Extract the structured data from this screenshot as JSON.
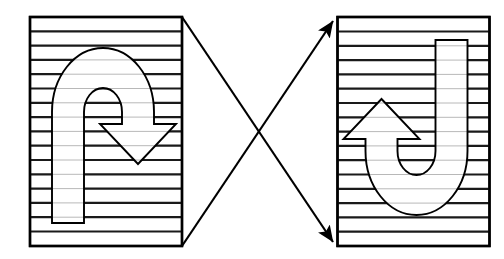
{
  "canvas": {
    "width": 504,
    "height": 259,
    "background": "#ffffff",
    "title": "Mental rotation figure pair"
  },
  "style": {
    "outline_color": "#000000",
    "stripe_outside_color": "#1a1a1a",
    "stripe_inside_color": "#b0b0b0",
    "shape_fill": "#ffffff",
    "panel_fill": "#ffffff",
    "arrow_color": "#000000",
    "panel_border_width": 2.4,
    "stripe_outside_width": 2.2,
    "stripe_inside_width": 0.9,
    "shape_outline_width": 1.9,
    "connector_width": 2.2
  },
  "panels": [
    {
      "id": "left-panel",
      "label": "Left striped panel",
      "x": 30,
      "y": 17,
      "width": 152,
      "height": 229,
      "stripe_count": 16,
      "stripe_spacing": 14.3,
      "rotation_degrees": 0,
      "shape_name": "hook-arrow-shape"
    },
    {
      "id": "right-panel",
      "label": "Right striped panel",
      "x": 338,
      "y": 17,
      "width": 151,
      "height": 229,
      "stripe_count": 16,
      "stripe_spacing": 14.3,
      "rotation_degrees": 180,
      "shape_name": "hook-arrow-shape"
    }
  ],
  "shape": {
    "name": "hook-arrow-shape",
    "description": "U-turn hook with downward triangular arrowhead",
    "outer_arc_top_y": 48,
    "stem_bottom_y": 223,
    "arrow_tip_x": 138,
    "arrow_tip_y": 164
  },
  "connectors": [
    {
      "id": "connector-top-left-to-bottom-right",
      "label": "Diagonal from left panel top-right to right panel bottom-left",
      "from_x": 182,
      "from_y": 17,
      "to_x": 338,
      "to_y": 246,
      "arrowhead": "end",
      "direction": "down-right"
    },
    {
      "id": "connector-bottom-left-to-top-right",
      "label": "Diagonal from left panel bottom-right to right panel top-left",
      "from_x": 182,
      "from_y": 246,
      "to_x": 338,
      "to_y": 17,
      "arrowhead": "end",
      "direction": "up-right"
    }
  ]
}
